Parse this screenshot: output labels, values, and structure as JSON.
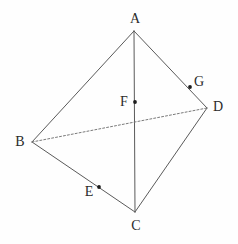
{
  "figure": {
    "canvas": {
      "width": 238,
      "height": 244,
      "background": "#fefefe"
    },
    "style": {
      "solid_line_color": "#5a5a5a",
      "dashed_line_color": "#7a7a7a",
      "point_color": "#1c1c1c",
      "label_color": "#2b2b2b",
      "solid_stroke_width": 1,
      "dashed_stroke_width": 1,
      "dash_pattern": "2,2"
    },
    "points": [
      {
        "id": "A",
        "label": "A",
        "x": 134,
        "y": 31,
        "marker": false,
        "label_x": 135,
        "label_y": 19
      },
      {
        "id": "B",
        "label": "B",
        "x": 32,
        "y": 142,
        "marker": false,
        "label_x": 20,
        "label_y": 142
      },
      {
        "id": "C",
        "label": "C",
        "x": 135,
        "y": 212,
        "marker": false,
        "label_x": 136,
        "label_y": 226
      },
      {
        "id": "D",
        "label": "D",
        "x": 207,
        "y": 108,
        "marker": false,
        "label_x": 218,
        "label_y": 107
      },
      {
        "id": "E",
        "label": "E",
        "x": 99,
        "y": 187,
        "marker": true,
        "label_x": 89,
        "label_y": 192
      },
      {
        "id": "F",
        "label": "F",
        "x": 135,
        "y": 102,
        "marker": true,
        "label_x": 124,
        "label_y": 102
      },
      {
        "id": "G",
        "label": "G",
        "x": 190,
        "y": 87,
        "marker": true,
        "label_x": 199,
        "label_y": 82
      }
    ],
    "segments": [
      {
        "id": "AB",
        "from": "A",
        "to": "B",
        "style": "solid"
      },
      {
        "id": "AD",
        "from": "A",
        "to": "D",
        "style": "solid"
      },
      {
        "id": "BC",
        "from": "B",
        "to": "C",
        "style": "solid"
      },
      {
        "id": "DC",
        "from": "D",
        "to": "C",
        "style": "solid"
      },
      {
        "id": "AC",
        "from": "A",
        "to": "C",
        "style": "solid"
      },
      {
        "id": "BD",
        "from": "B",
        "to": "D",
        "style": "dashed"
      }
    ]
  }
}
